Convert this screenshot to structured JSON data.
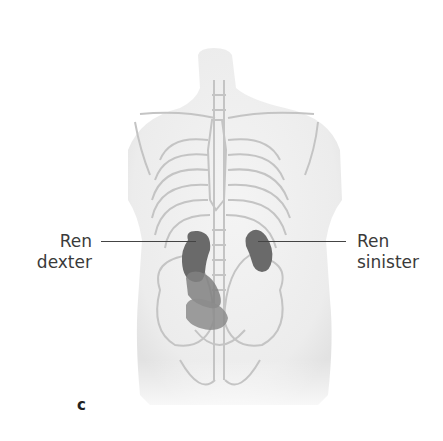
{
  "figure": {
    "panel_letter": "c",
    "labels": {
      "right_kidney": {
        "line1": "Ren",
        "line2": "dexter"
      },
      "left_kidney": {
        "line1": "Ren",
        "line2": "sinister"
      }
    },
    "colors": {
      "background": "#ffffff",
      "body_fill": "#efefef",
      "skeleton_stroke": "#c4c4c4",
      "kidney_fill": "#6a6a6a",
      "kidney_ghost_fill": "#8a8a8a",
      "text": "#3a3a3a"
    }
  }
}
